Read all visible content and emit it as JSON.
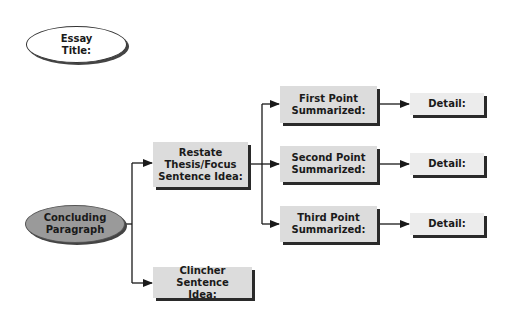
{
  "diagram": {
    "type": "concept-map",
    "title_node": {
      "line1": "Essay",
      "line2": "Title:"
    },
    "root": {
      "line1": "Concluding",
      "line2": "Paragraph"
    },
    "restate": {
      "line1": "Restate",
      "line2": "Thesis/Focus",
      "line3": "Sentence Idea:"
    },
    "clincher": {
      "line1": "Clincher Sentence",
      "line2": "Idea:"
    },
    "points": [
      {
        "line1": "First Point",
        "line2": "Summarized:",
        "detail": "Detail:"
      },
      {
        "line1": "Second Point",
        "line2": "Summarized:",
        "detail": "Detail:"
      },
      {
        "line1": "Third Point",
        "line2": "Summarized:",
        "detail": "Detail:"
      }
    ],
    "colors": {
      "box_fill": "#dcdcdc",
      "detail_fill": "#ececec",
      "root_fill": "#9a9a9a",
      "shadow": "#2a2a2a",
      "line": "#1a1a1a"
    }
  }
}
